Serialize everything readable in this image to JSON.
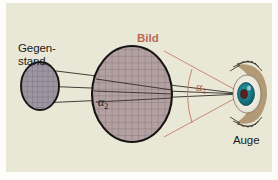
{
  "figure": {
    "background_color": "#e9e7d6",
    "labels": {
      "object_line1": "Gegen-",
      "object_line2": "stand",
      "image": "Bild",
      "eye": "Auge",
      "angle_large": "α",
      "angle_large_sub": "2",
      "angle_small": "α",
      "angle_small_sub": "1"
    },
    "colors": {
      "panel": "#e9e7d6",
      "text": "#1a1a1a",
      "image_label": "#bd6a55",
      "ray_black": "#23201c",
      "ray_red": "#c07a63",
      "small_ellipse_fill": "#9c95a0",
      "large_ellipse_fill": "#b09b9c",
      "ellipse_stroke": "#171513",
      "iris": "#1c7b86",
      "pupil": "#5e1f21",
      "sclera": "#f2f0e8",
      "eyelid": "#b49a78"
    },
    "elements": {
      "object_ellipse": "small-grid-ellipse",
      "image_ellipse": "large-grid-ellipse",
      "eye": "human-eye",
      "rays_object": "black-ray-lines",
      "rays_image": "red-ray-lines",
      "angle_marker_large": "alpha2-arc",
      "angle_marker_small": "alpha1-arc"
    }
  }
}
